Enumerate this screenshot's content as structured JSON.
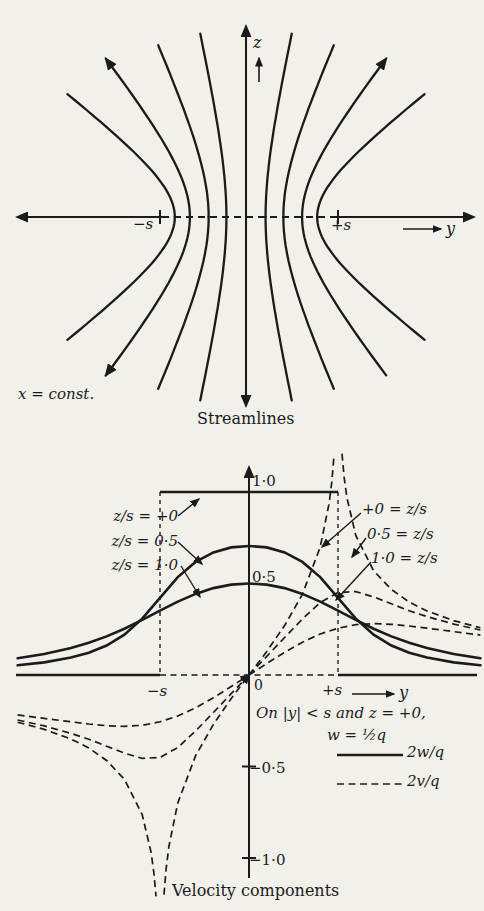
{
  "colors": {
    "ink": "#1b1b1b",
    "paper": "#f2f0ea"
  },
  "top_diagram": {
    "z_axis_label": "z",
    "y_axis_label": "y",
    "left_tick": "−s",
    "right_tick": "+s",
    "plane_note": "x = const.",
    "caption": "Streamlines"
  },
  "bottom_chart": {
    "tick_1_0": "1·0",
    "tick_0_5": "0·5",
    "origin": "0",
    "tick_m0_5": "−0·5",
    "tick_m1_0": "−1·0",
    "left_tick": "−s",
    "right_tick": "+s",
    "y_axis_label": "y",
    "curve_label_w_0": "z/s = +0",
    "curve_label_w_05": "z/s = 0·5",
    "curve_label_w_10": "z/s = 1·0",
    "curve_label_v_0": "+0 = z/s",
    "curve_label_v_05": "0·5 = z/s",
    "curve_label_v_10": "1·0 = z/s",
    "note_line1": "On |y| < s and z = +0,",
    "note_line2": "w = ½q",
    "legend_solid": "2w/q",
    "legend_dashed": "2v/q",
    "caption": "Velocity components"
  },
  "chart_data": [
    {
      "type": "line",
      "title": "Streamlines",
      "plane": "x = const.",
      "description": "Streamlines of flow emitted from a line slot occupying −s < y < +s; confocal hyperbolas with foci at y = ±s, symmetric about both axes. Central streamline is the z-axis; the y-axis beyond ±s is the limiting streamline.",
      "foci_y_over_s": [
        -1,
        1
      ],
      "hyperbola_vertex_a_over_s": [
        0.22,
        0.42,
        0.63,
        0.8
      ],
      "clip_z_over_s": [
        2.06,
        1.93,
        1.78,
        1.38
      ],
      "arrowed_curves": [
        "a=0.63 upper-left",
        "a=0.63 upper-right",
        "a=0.63 lower-left",
        "z-axis both ends",
        "y-axis both ends"
      ],
      "axes": {
        "vertical": "z",
        "horizontal": "y"
      }
    },
    {
      "type": "line",
      "title": "Velocity components",
      "xlabel": "y/s",
      "ylabel": "2w/q (solid), 2v/q (dashed)",
      "xlim": [
        -2.6,
        2.6
      ],
      "ylim": [
        -1.23,
        1.23
      ],
      "x_marks": [
        "−s",
        "+s"
      ],
      "y_ticks": [
        1.0,
        0.5,
        0,
        -0.5,
        -1.0
      ],
      "note": "On |y| < s and z = +0, w = q/2",
      "series": [
        {
          "name": "2w/q, z/s=+0",
          "style": "solid",
          "symmetry": "even",
          "special": "tophat",
          "points": [
            [
              -2.6,
              0
            ],
            [
              -1,
              0
            ],
            [
              -1,
              1
            ],
            [
              1,
              1
            ],
            [
              1,
              0
            ],
            [
              2.6,
              0
            ]
          ]
        },
        {
          "name": "2w/q, z/s=0.5",
          "style": "solid",
          "symmetry": "even",
          "points": [
            [
              0,
              0.705
            ],
            [
              0.2,
              0.697
            ],
            [
              0.4,
              0.67
            ],
            [
              0.6,
              0.618
            ],
            [
              0.8,
              0.535
            ],
            [
              1.0,
              0.422
            ],
            [
              1.2,
              0.308
            ],
            [
              1.4,
              0.22
            ],
            [
              1.6,
              0.161
            ],
            [
              1.8,
              0.122
            ],
            [
              2.0,
              0.095
            ],
            [
              2.3,
              0.069
            ],
            [
              2.6,
              0.053
            ]
          ]
        },
        {
          "name": "2w/q, z/s=1.0",
          "style": "solid",
          "symmetry": "even",
          "points": [
            [
              0,
              0.5
            ],
            [
              0.2,
              0.494
            ],
            [
              0.4,
              0.475
            ],
            [
              0.6,
              0.443
            ],
            [
              0.8,
              0.401
            ],
            [
              1.0,
              0.352
            ],
            [
              1.2,
              0.301
            ],
            [
              1.4,
              0.253
            ],
            [
              1.6,
              0.211
            ],
            [
              1.8,
              0.176
            ],
            [
              2.0,
              0.148
            ],
            [
              2.3,
              0.115
            ],
            [
              2.6,
              0.091
            ]
          ]
        },
        {
          "name": "2v/q, z/s=+0",
          "style": "dashed",
          "symmetry": "odd",
          "singular_at": 1,
          "segments": [
            [
              [
                0,
                0
              ],
              [
                0.2,
                0.129
              ],
              [
                0.4,
                0.27
              ],
              [
                0.6,
                0.441
              ],
              [
                0.8,
                0.699
              ],
              [
                0.9,
                0.937
              ],
              [
                0.93,
                1.056
              ],
              [
                0.955,
                1.2
              ]
            ],
            [
              [
                1.045,
                1.21
              ],
              [
                1.07,
                1.078
              ],
              [
                1.1,
                0.969
              ],
              [
                1.2,
                0.763
              ],
              [
                1.4,
                0.57
              ],
              [
                1.6,
                0.467
              ],
              [
                1.8,
                0.399
              ],
              [
                2.0,
                0.35
              ],
              [
                2.3,
                0.297
              ],
              [
                2.6,
                0.258
              ]
            ]
          ]
        },
        {
          "name": "2v/q, z/s=0.5",
          "style": "dashed",
          "symmetry": "odd",
          "points": [
            [
              0,
              0
            ],
            [
              0.2,
              0.102
            ],
            [
              0.4,
              0.205
            ],
            [
              0.6,
              0.306
            ],
            [
              0.8,
              0.396
            ],
            [
              1.0,
              0.451
            ],
            [
              1.2,
              0.456
            ],
            [
              1.4,
              0.427
            ],
            [
              1.6,
              0.389
            ],
            [
              1.8,
              0.351
            ],
            [
              2.0,
              0.319
            ],
            [
              2.3,
              0.278
            ],
            [
              2.6,
              0.246
            ]
          ]
        },
        {
          "name": "2v/q, z/s=1.0",
          "style": "dashed",
          "symmetry": "odd",
          "points": [
            [
              0,
              0
            ],
            [
              0.2,
              0.063
            ],
            [
              0.4,
              0.124
            ],
            [
              0.6,
              0.179
            ],
            [
              0.8,
              0.224
            ],
            [
              1.0,
              0.256
            ],
            [
              1.2,
              0.275
            ],
            [
              1.4,
              0.281
            ],
            [
              1.6,
              0.277
            ],
            [
              1.8,
              0.268
            ],
            [
              2.0,
              0.256
            ],
            [
              2.3,
              0.237
            ],
            [
              2.6,
              0.218
            ]
          ]
        }
      ],
      "legend": [
        {
          "style": "solid",
          "label": "2w/q"
        },
        {
          "style": "dashed",
          "label": "2v/q"
        }
      ]
    }
  ]
}
